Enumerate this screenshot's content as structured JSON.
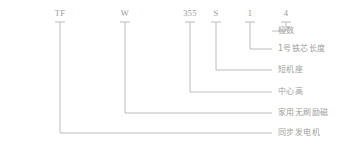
{
  "diagram": {
    "kind": "model-designation-breakdown",
    "title_text": "",
    "line_color": "#b5b5b5",
    "text_color": "#9a9a9a",
    "background_color": "#ffffff",
    "full_code": "TFW355S14",
    "segments": [
      {
        "code": "TF",
        "label": "同步发电机",
        "code_x": 60,
        "code_y": 16,
        "tick_y": 22,
        "drop_y": 133,
        "label_x": 278,
        "label_y": 133
      },
      {
        "code": "W",
        "label": "家用无刷励磁",
        "code_x": 125,
        "code_y": 16,
        "tick_y": 22,
        "drop_y": 113,
        "label_x": 278,
        "label_y": 113
      },
      {
        "code": "355",
        "label": "中心高",
        "code_x": 190,
        "code_y": 16,
        "tick_y": 22,
        "drop_y": 92,
        "label_x": 278,
        "label_y": 92
      },
      {
        "code": "S",
        "label": "短机座",
        "code_x": 216,
        "code_y": 16,
        "tick_y": 22,
        "drop_y": 70,
        "label_x": 278,
        "label_y": 70
      },
      {
        "code": "1",
        "label": "1号铁芯长度",
        "code_x": 250,
        "code_y": 16,
        "tick_y": 22,
        "drop_y": 49,
        "label_x": 278,
        "label_y": 49
      },
      {
        "code": "4",
        "label": "极数",
        "code_x": 286,
        "code_y": 16,
        "tick_y": 22,
        "drop_y": 31,
        "label_x": 278,
        "label_y": 31
      }
    ]
  }
}
